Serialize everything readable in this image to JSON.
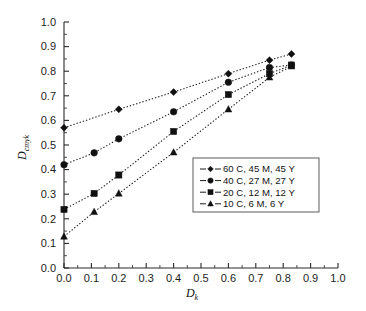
{
  "chart_data": {
    "type": "line",
    "title": "",
    "xlabel": "D_k",
    "ylabel": "D_cmyk",
    "xlabel_base": "D",
    "xlabel_sub": "k",
    "ylabel_base": "D",
    "ylabel_sub": "cmyk",
    "xlim": [
      0.0,
      1.0
    ],
    "ylim": [
      0.0,
      1.0
    ],
    "grid": false,
    "legend_position": "center-right-inside",
    "xticks": [
      "0.0",
      "0.1",
      "0.2",
      "0.3",
      "0.4",
      "0.5",
      "0.6",
      "0.7",
      "0.8",
      "0.9",
      "1.0"
    ],
    "yticks": [
      "0.0",
      "0.1",
      "0.2",
      "0.3",
      "0.4",
      "0.5",
      "0.6",
      "0.7",
      "0.8",
      "0.9",
      "1.0"
    ],
    "xtick_values": [
      0.0,
      0.1,
      0.2,
      0.3,
      0.4,
      0.5,
      0.6,
      0.7,
      0.8,
      0.9,
      1.0
    ],
    "ytick_values": [
      0.0,
      0.1,
      0.2,
      0.3,
      0.4,
      0.5,
      0.6,
      0.7,
      0.8,
      0.9,
      1.0
    ],
    "minor_tick_step": 0.05,
    "series": [
      {
        "name": "60 C, 45 M, 45 Y",
        "marker": "diamond",
        "x": [
          0.0,
          0.2,
          0.4,
          0.6,
          0.75,
          0.83
        ],
        "values": [
          0.57,
          0.645,
          0.715,
          0.79,
          0.845,
          0.87
        ]
      },
      {
        "name": "40 C, 27 M, 27 Y",
        "marker": "circle",
        "x": [
          0.0,
          0.11,
          0.2,
          0.4,
          0.6,
          0.75,
          0.83
        ],
        "values": [
          0.42,
          0.468,
          0.525,
          0.635,
          0.755,
          0.815,
          0.825
        ]
      },
      {
        "name": "20 C, 12 M, 12 Y",
        "marker": "square",
        "x": [
          0.0,
          0.11,
          0.2,
          0.4,
          0.6,
          0.75,
          0.83
        ],
        "values": [
          0.238,
          0.303,
          0.378,
          0.555,
          0.705,
          0.79,
          0.825
        ]
      },
      {
        "name": "10 C, 6 M, 6 Y",
        "marker": "triangle",
        "x": [
          0.0,
          0.11,
          0.2,
          0.4,
          0.6,
          0.75,
          0.83
        ],
        "values": [
          0.128,
          0.228,
          0.303,
          0.47,
          0.645,
          0.775,
          0.82
        ]
      }
    ]
  },
  "legend": {
    "entries": [
      {
        "label": "60 C, 45 M, 45 Y",
        "marker": "diamond"
      },
      {
        "label": "40 C, 27 M, 27 Y",
        "marker": "circle"
      },
      {
        "label": "20 C, 12 M, 12 Y",
        "marker": "square"
      },
      {
        "label": "10 C, 6 M, 6 Y",
        "marker": "triangle"
      }
    ]
  },
  "colors": {
    "ink": "#101010",
    "axis": "#2a2a2a",
    "background": "#ffffff"
  }
}
